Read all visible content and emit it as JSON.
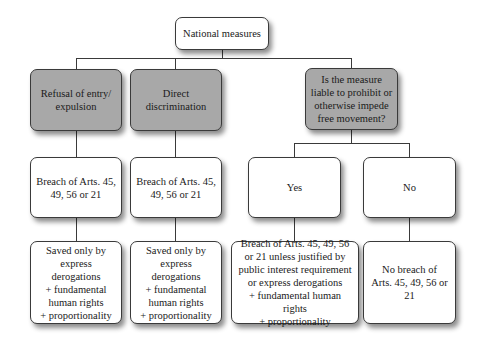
{
  "diagram": {
    "root": {
      "label": "National measures"
    },
    "level1": [
      {
        "label": "Refusal of entry/\nexpulsion",
        "shaded": true
      },
      {
        "label": "Direct\ndiscrimination",
        "shaded": true
      },
      {
        "label": "Is the measure\nliable to prohibit or\notherwise impede\nfree movement?",
        "shaded": true
      }
    ],
    "level2": [
      {
        "label": "Breach of Arts. 45,\n49, 56 or 21"
      },
      {
        "label": "Breach of Arts. 45,\n49, 56 or 21"
      },
      {
        "label": "Yes"
      },
      {
        "label": "No"
      }
    ],
    "level3": [
      {
        "label": "Saved only by\nexpress\nderogations\n+ fundamental\nhuman rights\n+ proportionality"
      },
      {
        "label": "Saved only by\nexpress\nderogations\n+ fundamental\nhuman rights\n+ proportionality"
      },
      {
        "label": "Breach of Arts. 45, 49, 56\nor 21 unless justified by\npublic interest requirement\nor express derogations\n+ fundamental human rights\n+ proportionality"
      },
      {
        "label": "No breach of\nArts. 45, 49, 56 or 21"
      }
    ],
    "colors": {
      "shaded_fill": "#a8a8a8",
      "fill": "#ffffff",
      "stroke": "#3a3a3a"
    }
  }
}
